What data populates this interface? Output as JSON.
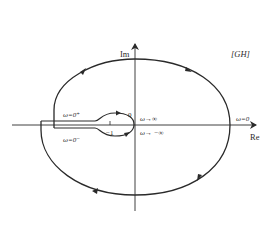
{
  "diagram": {
    "title_tag": "[GH]",
    "axes": {
      "x_label": "Re",
      "y_label": "Im"
    },
    "labels": {
      "origin": "0",
      "minus_one": "−1",
      "omega_zero_plus": "ω=0⁺",
      "omega_zero_minus": "ω=0⁻",
      "omega_to_inf": "ω→∞",
      "omega_to_minus_inf": "ω→ −∞",
      "omega_zero": "ω=0"
    },
    "colors": {
      "stroke": "#2a2a2a",
      "background": "#ffffff"
    }
  }
}
